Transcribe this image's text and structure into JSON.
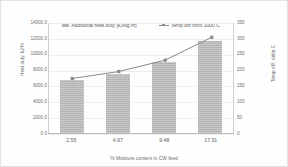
{
  "chart_data": {
    "type": "bar",
    "title": "",
    "categories": [
      "2.55",
      "4.97",
      "9.48",
      "17.31"
    ],
    "xlabel": "% Moisture content in CW feed",
    "ylabel": "Heat duty, kJ/hr",
    "y2label": "Temp diff, delta C",
    "ylim": [
      0,
      14000
    ],
    "y2lim": [
      0,
      350
    ],
    "grid": true,
    "legend_position": "top-center",
    "series": [
      {
        "name": "Additional heat duty [kJ/kg.hr]",
        "type": "bar",
        "axis": "left",
        "color": "#b4b4b4",
        "values": [
          6700,
          7500,
          9000,
          11600
        ]
      },
      {
        "name": "Temp diff from 1000 C",
        "type": "line",
        "axis": "right",
        "color": "#8a8a8a",
        "values": [
          175,
          197,
          233,
          305
        ]
      }
    ],
    "yticks": [
      "0.0",
      "2000.0",
      "4000.0",
      "6000.0",
      "8000.0",
      "10000.0",
      "12000.0",
      "14000.0"
    ],
    "ytick_values": [
      0,
      2000,
      4000,
      6000,
      8000,
      10000,
      12000,
      14000
    ],
    "y2ticks": [
      "0",
      "50",
      "100",
      "150",
      "200",
      "250",
      "300",
      "350"
    ],
    "y2tick_values": [
      0,
      50,
      100,
      150,
      200,
      250,
      300,
      350
    ]
  },
  "legend": {
    "item0": "Additional heat duty [kJ/kg.hr]",
    "item1": "Temp diff from 1000 C"
  },
  "axes": {
    "left_title": "Heat duty, kJ/hr",
    "right_title": "Temp diff, delta C",
    "x_title": "% Moisture content in CW feed"
  }
}
